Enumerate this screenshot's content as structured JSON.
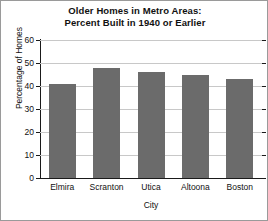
{
  "chart_data": {
    "type": "bar",
    "title": "Older Homes in Metro Areas: Percent Built in 1940 or Earlier",
    "title_line1": "Older Homes in Metro Areas:",
    "title_line2": "Percent Built in 1940 or Earlier",
    "xlabel": "City",
    "ylabel": "Percentage of Homes",
    "categories": [
      "Elmira",
      "Scranton",
      "Utica",
      "Altoona",
      "Boston"
    ],
    "values": [
      41,
      48,
      46,
      45,
      43
    ],
    "ylim": [
      0,
      60
    ],
    "yticks": [
      0,
      10,
      20,
      30,
      40,
      50,
      60
    ],
    "ytick_labels": [
      "0",
      "10",
      "20",
      "30",
      "40",
      "50",
      "60"
    ],
    "grid": true,
    "legend": null,
    "bar_color": "#6b6b6b",
    "gridline_color": "#c8c8c8",
    "axis_color": "#1a1a1a",
    "background_color": "#ffffff"
  }
}
